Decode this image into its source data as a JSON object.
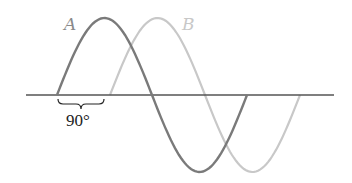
{
  "diagram": {
    "waves": [
      {
        "label": "A",
        "color": "#7a7a7a",
        "phase_deg": 0
      },
      {
        "label": "B",
        "color": "#c8c8c8",
        "phase_deg": 90
      }
    ],
    "axis_color": "#555555",
    "brace_label": "90°"
  }
}
